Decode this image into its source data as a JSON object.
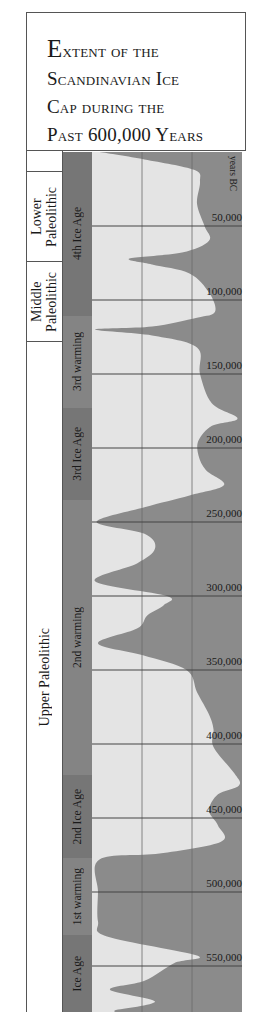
{
  "title": {
    "lines": [
      "Extent of the",
      "Scandinavian Ice",
      "Cap during the",
      "Past 600,000 Years"
    ]
  },
  "units_label": "years BC",
  "colors": {
    "ice": "#8b8b8b",
    "background": "#e4e4e4",
    "band": "#7e7e7e",
    "band_ice_age": "#767676",
    "band_warming": "#848484",
    "gridline": "#444444"
  },
  "epochs": [
    {
      "label": "",
      "top": 0,
      "height": 21
    },
    {
      "label": "Lower Paleolithic",
      "lines": [
        "Lower",
        "Paleolithic"
      ],
      "top": 21,
      "height": 90
    },
    {
      "label": "Middle Paleolithic",
      "lines": [
        "Middle",
        "Paleolithic"
      ],
      "top": 111,
      "height": 80
    },
    {
      "label": "Upper Paleolithic",
      "lines": [
        "Upper Paleolithic"
      ],
      "top": 191,
      "height": 670
    }
  ],
  "periods": [
    {
      "label": "4th Ice Age",
      "type": "ice",
      "top": 0,
      "height": 164
    },
    {
      "label": "3rd warming",
      "type": "warm",
      "top": 164,
      "height": 92
    },
    {
      "label": "3rd Ice Age",
      "type": "ice",
      "top": 256,
      "height": 92
    },
    {
      "label": "2nd warming",
      "type": "warm",
      "top": 348,
      "height": 275
    },
    {
      "label": "2nd Ice Age",
      "type": "ice",
      "top": 623,
      "height": 83
    },
    {
      "label": "1st warming",
      "type": "warm",
      "top": 706,
      "height": 77
    },
    {
      "label": "Ice Age",
      "type": "ice",
      "top": 783,
      "height": 77
    }
  ],
  "chart_data": {
    "type": "area",
    "title": "Extent of the Scandinavian Ice Cap during the Past 600,000 Years",
    "ylabel": "years BC",
    "y_ticks": [
      "50,000",
      "100,000",
      "150,000",
      "200,000",
      "250,000",
      "300,000",
      "350,000",
      "400,000",
      "450,000",
      "500,000",
      "550,000"
    ],
    "y_tick_values": [
      50000,
      100000,
      150000,
      200000,
      250000,
      300000,
      350000,
      400000,
      450000,
      500000,
      550000
    ],
    "ylim": [
      0,
      580000
    ],
    "x_description": "relative extent of ice cap (0 = minimum, 1 = maximum)",
    "vertical_gridlines": 2,
    "profile": [
      [
        0,
        0.95
      ],
      [
        5000,
        0.65
      ],
      [
        12000,
        0.32
      ],
      [
        20000,
        0.28
      ],
      [
        35000,
        0.3
      ],
      [
        50000,
        0.25
      ],
      [
        60000,
        0.22
      ],
      [
        68000,
        0.4
      ],
      [
        72000,
        0.75
      ],
      [
        76000,
        0.6
      ],
      [
        82000,
        0.35
      ],
      [
        95000,
        0.22
      ],
      [
        108000,
        0.18
      ],
      [
        112000,
        0.3
      ],
      [
        118000,
        0.6
      ],
      [
        120000,
        0.98
      ],
      [
        124000,
        0.6
      ],
      [
        132000,
        0.3
      ],
      [
        150000,
        0.28
      ],
      [
        170000,
        0.2
      ],
      [
        180000,
        0.03
      ],
      [
        185000,
        0.2
      ],
      [
        195000,
        0.29
      ],
      [
        205000,
        0.29
      ],
      [
        215000,
        0.24
      ],
      [
        225000,
        0.12
      ],
      [
        232000,
        0.35
      ],
      [
        240000,
        0.65
      ],
      [
        250000,
        0.97
      ],
      [
        258000,
        0.65
      ],
      [
        268000,
        0.58
      ],
      [
        278000,
        0.7
      ],
      [
        290000,
        0.98
      ],
      [
        300000,
        0.5
      ],
      [
        306000,
        0.52
      ],
      [
        313000,
        0.63
      ],
      [
        322000,
        0.7
      ],
      [
        332000,
        0.96
      ],
      [
        340000,
        0.66
      ],
      [
        350000,
        0.37
      ],
      [
        365000,
        0.3
      ],
      [
        380000,
        0.22
      ],
      [
        390000,
        0.19
      ],
      [
        402000,
        0.19
      ],
      [
        420000,
        0.05
      ],
      [
        428000,
        0.02
      ],
      [
        434000,
        0.16
      ],
      [
        445000,
        0.22
      ],
      [
        455000,
        0.16
      ],
      [
        466000,
        0.14
      ],
      [
        474000,
        0.55
      ],
      [
        478000,
        0.95
      ],
      [
        500000,
        0.96
      ],
      [
        520000,
        0.96
      ],
      [
        530000,
        0.9
      ],
      [
        543000,
        0.3
      ],
      [
        548000,
        0.45
      ],
      [
        560000,
        0.65
      ],
      [
        566000,
        0.88
      ],
      [
        574000,
        0.58
      ],
      [
        580000,
        0.85
      ]
    ],
    "grid": true
  }
}
